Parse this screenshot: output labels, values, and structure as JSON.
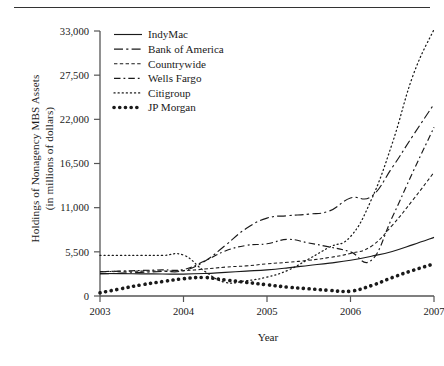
{
  "figure": {
    "has_top_rule": true,
    "background": "#ffffff",
    "ink_color": "#1a1a1a"
  },
  "chart_data": {
    "type": "line",
    "title": "",
    "subtitle": "",
    "xlabel": "Year",
    "ylabel": "Holdings of Nonagency MBS Assets\n(in millions of dollars)",
    "ylabel_line1": "Holdings of Nonagency MBS Assets",
    "ylabel_line2": "(in millions of dollars)",
    "xlim": [
      2003,
      2007
    ],
    "ylim": [
      0,
      33000
    ],
    "xticks": [
      2003,
      2004,
      2005,
      2006,
      2007
    ],
    "xtick_labels": [
      "2003",
      "2004",
      "2005",
      "2006",
      "2007"
    ],
    "yticks": [
      0,
      5500,
      11000,
      16500,
      22000,
      27500,
      33000
    ],
    "ytick_labels": [
      "0",
      "5,500",
      "11,000",
      "16,500",
      "22,000",
      "27,500",
      "33,000"
    ],
    "grid": false,
    "legend_position": "top-left-inside",
    "x": [
      2003.0,
      2003.25,
      2003.5,
      2003.75,
      2004.0,
      2004.25,
      2004.5,
      2004.75,
      2005.0,
      2005.25,
      2005.5,
      2005.75,
      2006.0,
      2006.25,
      2006.5,
      2006.75,
      2007.0
    ],
    "series": [
      {
        "name": "IndyMac",
        "style": "solid",
        "values": [
          2800,
          2780,
          2760,
          2740,
          2730,
          2800,
          2950,
          3100,
          3250,
          3500,
          3800,
          4100,
          4450,
          4950,
          5550,
          6400,
          7300
        ]
      },
      {
        "name": "Bank of America",
        "style": "dash-dot-long",
        "values": [
          2750,
          2850,
          2950,
          3050,
          3150,
          4300,
          6300,
          8400,
          9700,
          10000,
          10200,
          10600,
          12200,
          12400,
          16000,
          20000,
          23900
        ]
      },
      {
        "name": "Countrywide",
        "style": "dashed-short",
        "values": [
          3050,
          3080,
          3100,
          3120,
          3150,
          3350,
          3600,
          3750,
          4000,
          4200,
          4450,
          4800,
          5300,
          6200,
          8800,
          12000,
          15400
        ]
      },
      {
        "name": "Wells Fargo",
        "style": "dash-dot",
        "values": [
          3000,
          3100,
          3180,
          3250,
          3300,
          4350,
          5600,
          6300,
          6500,
          7050,
          6600,
          6100,
          5500,
          4450,
          9800,
          15500,
          21000
        ]
      },
      {
        "name": "Citigroup",
        "style": "dotted-fine",
        "values": [
          5050,
          5050,
          5050,
          5050,
          5100,
          3100,
          1700,
          1900,
          2350,
          3200,
          4600,
          6100,
          7400,
          12000,
          19000,
          27500,
          33200
        ]
      },
      {
        "name": "JP Morgan",
        "style": "dotted-bold",
        "values": [
          400,
          900,
          1400,
          1800,
          2150,
          2300,
          2000,
          1700,
          1400,
          1100,
          900,
          700,
          600,
          1300,
          2300,
          3200,
          4000
        ]
      }
    ],
    "notes": {
      "citigroup_peak_value": 33200,
      "citigroup_peak_year": 2007,
      "bank_of_america_end": 23900,
      "wells_fargo_end": 21000,
      "countrywide_end": 15400,
      "indymac_end": 7300,
      "jp_morgan_end": 4000
    }
  },
  "legend": {
    "entries": [
      {
        "label": "IndyMac",
        "style": "solid"
      },
      {
        "label": "Bank of America",
        "style": "dash-dot-long"
      },
      {
        "label": "Countrywide",
        "style": "dashed-short"
      },
      {
        "label": "Wells Fargo",
        "style": "dash-dot"
      },
      {
        "label": "Citigroup",
        "style": "dotted-fine"
      },
      {
        "label": "JP Morgan",
        "style": "dotted-bold"
      }
    ]
  }
}
